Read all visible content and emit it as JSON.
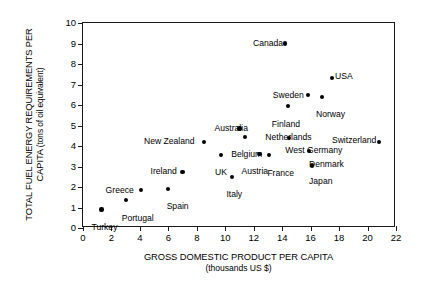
{
  "chart_data": {
    "type": "scatter",
    "title": "",
    "xlabel": "GROSS DOMESTIC PRODUCT PER CAPITA",
    "xlabel_sub": "(thousands US $)",
    "ylabel_line1": "TOTAL FUEL ENERGY",
    "ylabel_line2": "REQUIREMENTS PER CAPITA",
    "ylabel_sub": "(tons of oil equivalent)",
    "xlim": [
      0,
      22
    ],
    "ylim": [
      0,
      10
    ],
    "xticks": [
      0,
      2,
      4,
      6,
      8,
      10,
      12,
      14,
      16,
      18,
      20,
      22
    ],
    "yticks": [
      0,
      1,
      2,
      3,
      4,
      5,
      6,
      7,
      8,
      9,
      10
    ],
    "grid": false,
    "legend": false,
    "marker_color": "#000000",
    "axis_color": "#1a1a1a",
    "points": [
      {
        "label": "Turkey",
        "x": 1.3,
        "y": 0.9,
        "lx": -10,
        "ly": 13
      },
      {
        "label": "Portugal",
        "x": 3.0,
        "y": 1.35,
        "lx": -4,
        "ly": 14
      },
      {
        "label": "Greece",
        "x": 4.05,
        "y": 1.85,
        "lx": -35,
        "ly": -4
      },
      {
        "label": "Spain",
        "x": 5.95,
        "y": 1.9,
        "lx": -1,
        "ly": 13
      },
      {
        "label": "Ireland",
        "x": 7.0,
        "y": 2.75,
        "lx": -32,
        "ly": -5
      },
      {
        "label": "New Zealand",
        "x": 8.5,
        "y": 4.2,
        "lx": -60,
        "ly": -5
      },
      {
        "label": "UK",
        "x": 9.7,
        "y": 3.55,
        "lx": -6,
        "ly": 13
      },
      {
        "label": "Italy",
        "x": 10.5,
        "y": 2.5,
        "lx": -6,
        "ly": 13
      },
      {
        "label": "Australia",
        "x": 11.0,
        "y": 4.85,
        "lx": -25,
        "ly": -5
      },
      {
        "label": "Belgium",
        "x": 11.4,
        "y": 4.45,
        "lx": -14,
        "ly": 13
      },
      {
        "label": "Austria",
        "x": 12.4,
        "y": 3.6,
        "lx": -18,
        "ly": 13
      },
      {
        "label": "France",
        "x": 13.1,
        "y": 3.55,
        "lx": -2,
        "ly": 14
      },
      {
        "label": "Canada",
        "x": 14.2,
        "y": 9.0,
        "lx": -32,
        "ly": -5
      },
      {
        "label": "Netherlands",
        "x": 14.5,
        "y": 4.4,
        "lx": -24,
        "ly": -5
      },
      {
        "label": "Finland",
        "x": 14.4,
        "y": 5.95,
        "lx": -16,
        "ly": 14
      },
      {
        "label": "Sweden",
        "x": 15.8,
        "y": 6.5,
        "lx": -35,
        "ly": -4
      },
      {
        "label": "West Germany",
        "x": 15.9,
        "y": 3.75,
        "lx": -24,
        "ly": -5
      },
      {
        "label": "Denmark",
        "x": 16.1,
        "y": 3.05,
        "lx": -3,
        "ly": -5
      },
      {
        "label": "Japan",
        "x": 16.1,
        "y": 3.05,
        "lx": -3,
        "ly": 12
      },
      {
        "label": "Norway",
        "x": 16.8,
        "y": 6.4,
        "lx": -6,
        "ly": 13
      },
      {
        "label": "USA",
        "x": 17.5,
        "y": 7.3,
        "lx": 3,
        "ly": -6
      },
      {
        "label": "Switzerland",
        "x": 20.8,
        "y": 4.2,
        "lx": -47,
        "ly": -6
      }
    ]
  }
}
